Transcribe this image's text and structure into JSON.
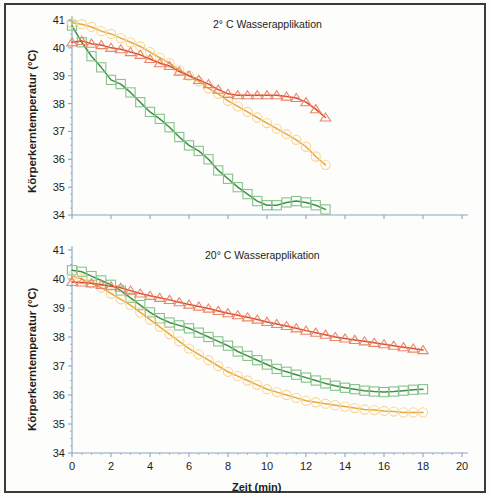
{
  "figure": {
    "background": "#fdfdfc",
    "border_color": "#3a3a38",
    "axis_color": "#8aa5c0",
    "tick_color": "#8aa5c0"
  },
  "axes": {
    "y_label": "Körperkerntemperatur (°C)",
    "x_label": "Zeit (min)",
    "y_ticks": [
      "34",
      "35",
      "36",
      "37",
      "38",
      "39",
      "40",
      "41"
    ],
    "x_ticks": [
      "0",
      "2",
      "4",
      "6",
      "8",
      "10",
      "12",
      "14",
      "16",
      "18",
      "20"
    ],
    "y_min": 34,
    "y_max": 41,
    "x_min": 0,
    "x_max": 20
  },
  "series_style": {
    "green": {
      "name": "green-squares",
      "line": "#3f8f46",
      "marker_edge": "#86c48c",
      "marker": "square"
    },
    "orange": {
      "name": "orange-circles",
      "line": "#e8a93a",
      "marker_edge": "#f6d79a",
      "marker": "circle"
    },
    "red": {
      "name": "red-triangles",
      "line": "#de4a28",
      "marker_edge": "#e8876c",
      "marker": "triangle"
    }
  },
  "chart_data": [
    {
      "type": "line",
      "panel": "top",
      "title": "2° C Wasserapplikation",
      "xlabel": "",
      "ylabel": "Körperkerntemperatur (°C)",
      "xlim": [
        0,
        20
      ],
      "ylim": [
        34,
        41
      ],
      "grid": false,
      "legend": "none",
      "x": [
        0,
        0.5,
        1,
        1.5,
        2,
        2.5,
        3,
        3.5,
        4,
        4.5,
        5,
        5.5,
        6,
        6.5,
        7,
        7.5,
        8,
        8.5,
        9,
        9.5,
        10,
        10.5,
        11,
        11.5,
        12,
        12.5,
        13
      ],
      "series": [
        {
          "name": "green-squares",
          "marker": "square",
          "values": [
            40.8,
            40.2,
            39.7,
            39.3,
            38.85,
            38.7,
            38.4,
            38.05,
            37.7,
            37.45,
            37.15,
            36.8,
            36.5,
            36.3,
            36.0,
            35.6,
            35.3,
            35.0,
            34.75,
            34.5,
            34.35,
            34.35,
            34.45,
            34.5,
            34.45,
            34.35,
            34.2
          ]
        },
        {
          "name": "orange-circles",
          "marker": "circle",
          "values": [
            40.9,
            40.85,
            40.75,
            40.6,
            40.5,
            40.35,
            40.2,
            40.05,
            39.85,
            39.65,
            39.45,
            39.2,
            39.0,
            38.8,
            38.55,
            38.35,
            38.1,
            37.9,
            37.7,
            37.5,
            37.3,
            37.1,
            36.9,
            36.7,
            36.45,
            36.1,
            35.8
          ]
        },
        {
          "name": "red-triangles",
          "marker": "triangle",
          "values": [
            40.2,
            40.25,
            40.15,
            40.1,
            40.0,
            39.95,
            39.85,
            39.75,
            39.6,
            39.45,
            39.35,
            39.15,
            39.0,
            38.85,
            38.7,
            38.5,
            38.35,
            38.3,
            38.3,
            38.3,
            38.3,
            38.3,
            38.25,
            38.2,
            38.05,
            37.8,
            37.5
          ]
        }
      ]
    },
    {
      "type": "line",
      "panel": "bottom",
      "title": "20° C Wasserapplikation",
      "xlabel": "Zeit (min)",
      "ylabel": "Körperkerntemperatur (°C)",
      "xlim": [
        0,
        20
      ],
      "ylim": [
        34,
        41
      ],
      "grid": false,
      "legend": "none",
      "x": [
        0,
        0.5,
        1,
        1.5,
        2,
        2.5,
        3,
        3.5,
        4,
        4.5,
        5,
        5.5,
        6,
        6.5,
        7,
        7.5,
        8,
        8.5,
        9,
        9.5,
        10,
        10.5,
        11,
        11.5,
        12,
        12.5,
        13,
        13.5,
        14,
        14.5,
        15,
        15.5,
        16,
        16.5,
        17,
        17.5,
        18
      ],
      "series": [
        {
          "name": "green-squares",
          "marker": "square",
          "values": [
            40.3,
            40.25,
            40.1,
            39.95,
            39.8,
            39.6,
            39.35,
            39.1,
            38.85,
            38.65,
            38.5,
            38.4,
            38.3,
            38.15,
            38.0,
            37.85,
            37.7,
            37.5,
            37.35,
            37.2,
            37.05,
            36.9,
            36.8,
            36.7,
            36.6,
            36.5,
            36.4,
            36.32,
            36.25,
            36.2,
            36.15,
            36.12,
            36.1,
            36.12,
            36.15,
            36.18,
            36.2
          ]
        },
        {
          "name": "orange-circles",
          "marker": "circle",
          "values": [
            40.1,
            40.0,
            39.85,
            39.7,
            39.5,
            39.3,
            39.1,
            38.85,
            38.6,
            38.35,
            38.1,
            37.85,
            37.6,
            37.4,
            37.2,
            37.0,
            36.8,
            36.65,
            36.5,
            36.35,
            36.2,
            36.1,
            36.0,
            35.9,
            35.8,
            35.75,
            35.7,
            35.65,
            35.6,
            35.55,
            35.5,
            35.48,
            35.45,
            35.43,
            35.4,
            35.4,
            35.4
          ]
        },
        {
          "name": "red-triangles",
          "marker": "triangle",
          "values": [
            39.9,
            39.88,
            39.85,
            39.8,
            39.75,
            39.7,
            39.6,
            39.5,
            39.42,
            39.35,
            39.28,
            39.2,
            39.12,
            39.05,
            38.98,
            38.9,
            38.82,
            38.75,
            38.68,
            38.6,
            38.52,
            38.45,
            38.38,
            38.3,
            38.22,
            38.15,
            38.08,
            38.0,
            37.95,
            37.9,
            37.85,
            37.8,
            37.75,
            37.7,
            37.65,
            37.6,
            37.55
          ]
        }
      ]
    }
  ]
}
